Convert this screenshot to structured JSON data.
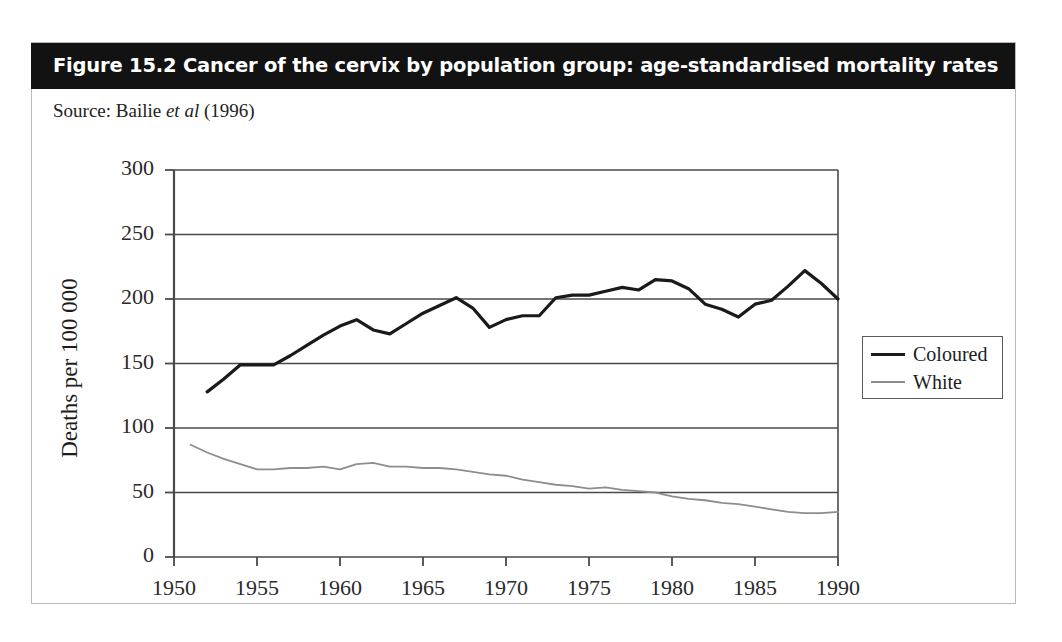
{
  "figure": {
    "title": "Figure 15.2 Cancer of the cervix by population group: age-standardised mortality rates",
    "source_prefix": "Source: Bailie ",
    "source_italic": "et al",
    "source_suffix": " (1996)",
    "title_bg": "#121212",
    "title_color": "#ffffff"
  },
  "legend": {
    "entries": [
      {
        "label": "Coloured",
        "color": "#1a1a1a"
      },
      {
        "label": "White",
        "color": "#8d8d8d"
      }
    ]
  },
  "chart_data": {
    "type": "line",
    "title": "Figure 15.2 Cancer of the cervix by population group: age-standardised mortality rates",
    "xlabel": "",
    "ylabel": "Deaths per 100 000",
    "xlim": [
      1950,
      1990
    ],
    "ylim": [
      0,
      300
    ],
    "xticks": [
      1950,
      1955,
      1960,
      1965,
      1970,
      1975,
      1980,
      1985,
      1990
    ],
    "yticks": [
      0,
      50,
      100,
      150,
      200,
      250,
      300
    ],
    "grid": "horizontal",
    "legend_position": "right",
    "x": [
      1951,
      1952,
      1953,
      1954,
      1955,
      1956,
      1957,
      1958,
      1959,
      1960,
      1961,
      1962,
      1963,
      1964,
      1965,
      1966,
      1967,
      1968,
      1969,
      1970,
      1971,
      1972,
      1973,
      1974,
      1975,
      1976,
      1977,
      1978,
      1979,
      1980,
      1981,
      1982,
      1983,
      1984,
      1985,
      1986,
      1987,
      1988,
      1989,
      1990
    ],
    "series": [
      {
        "name": "Coloured",
        "color": "#1a1a1a",
        "x": [
          1952,
          1953,
          1954,
          1955,
          1956,
          1957,
          1958,
          1959,
          1960,
          1961,
          1962,
          1963,
          1964,
          1965,
          1966,
          1967,
          1968,
          1969,
          1970,
          1971,
          1972,
          1973,
          1974,
          1975,
          1976,
          1977,
          1978,
          1979,
          1980,
          1981,
          1982,
          1983,
          1984,
          1985,
          1986,
          1987,
          1988,
          1989,
          1990
        ],
        "values": [
          128,
          138,
          149,
          149,
          149,
          156,
          164,
          172,
          179,
          184,
          176,
          173,
          181,
          189,
          195,
          201,
          193,
          178,
          184,
          187,
          187,
          201,
          203,
          203,
          206,
          209,
          207,
          215,
          214,
          208,
          196,
          192,
          186,
          196,
          199,
          210,
          222,
          212,
          200
        ]
      },
      {
        "name": "White",
        "color": "#8d8d8d",
        "x": [
          1951,
          1952,
          1953,
          1954,
          1955,
          1956,
          1957,
          1958,
          1959,
          1960,
          1961,
          1962,
          1963,
          1964,
          1965,
          1966,
          1967,
          1968,
          1969,
          1970,
          1971,
          1972,
          1973,
          1974,
          1975,
          1976,
          1977,
          1978,
          1979,
          1980,
          1981,
          1982,
          1983,
          1984,
          1985,
          1986,
          1987,
          1988,
          1989,
          1990
        ],
        "values": [
          87,
          81,
          76,
          72,
          68,
          68,
          69,
          69,
          70,
          68,
          72,
          73,
          70,
          70,
          69,
          69,
          68,
          66,
          64,
          63,
          60,
          58,
          56,
          55,
          53,
          54,
          52,
          51,
          50,
          47,
          45,
          44,
          42,
          41,
          39,
          37,
          35,
          34,
          34,
          35
        ]
      }
    ]
  },
  "axis_geometry": {
    "plot_left": 174,
    "plot_right": 838,
    "plot_top": 170,
    "plot_bottom": 557
  }
}
